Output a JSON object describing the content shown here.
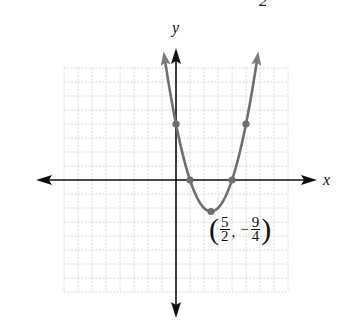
{
  "chart_data": {
    "type": "line",
    "title": "",
    "function": "y = x^2 - 5x + 4",
    "xlabel": "x",
    "ylabel": "y",
    "xlim": [
      -8,
      8
    ],
    "ylim": [
      -8,
      8
    ],
    "grid": true,
    "grid_step": 1,
    "legend": null,
    "series": [
      {
        "name": "parabola",
        "color": "#6e6e6e",
        "x": [
          -0.8,
          0,
          1,
          2,
          2.5,
          3,
          4,
          5,
          5.8
        ],
        "y": [
          8.64,
          4,
          0,
          -2,
          -2.25,
          -2,
          0,
          4,
          8.64
        ]
      }
    ],
    "marked_points": [
      {
        "x": 0,
        "y": 4
      },
      {
        "x": 1,
        "y": 0
      },
      {
        "x": 2.5,
        "y": -2.25
      },
      {
        "x": 4,
        "y": 0
      },
      {
        "x": 5,
        "y": 4
      }
    ],
    "annotations": [
      {
        "text": "(5/2, -9/4)",
        "x": 2.5,
        "y": -2.25
      }
    ]
  },
  "labels": {
    "x_axis": "x",
    "y_axis": "y",
    "top_fragment": "2",
    "vertex": {
      "x_num": "5",
      "x_den": "2",
      "sign": "−",
      "y_num": "9",
      "y_den": "4",
      "open": "(",
      "close": ")",
      "comma": ","
    }
  },
  "colors": {
    "axis": "#111111",
    "curve": "#6e6e6e",
    "point": "#6e6e6e",
    "grid": "#cfcfcf"
  }
}
